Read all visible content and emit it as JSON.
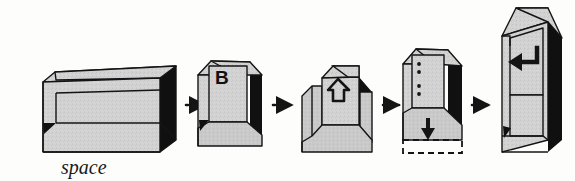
{
  "figure": {
    "type": "illustration",
    "background_color": "#fdfdfc",
    "outline_color": "#141414",
    "keytop_color": "#d2d2d2",
    "keyface_color": "#c9c9c9",
    "shadow_color": "#101010",
    "connector_style": "dotted-line-with-solid-arrowhead"
  },
  "keys": [
    {
      "id": "space",
      "order": 1,
      "caption": "space",
      "glyph": "",
      "glyph_name": "none",
      "description": "wide low spacebar keycap",
      "relative_size": "widest"
    },
    {
      "id": "letter-b",
      "order": 2,
      "caption": "",
      "glyph": "B",
      "glyph_name": "letter-b",
      "description": "standard single letter keycap",
      "relative_size": "standard"
    },
    {
      "id": "shift",
      "order": 3,
      "caption": "",
      "glyph": "⇧",
      "glyph_name": "up-arrow-outline-icon",
      "description": "shift keycap with side ridges and hollow up arrow",
      "relative_size": "tall-with-fins"
    },
    {
      "id": "dotted-travel",
      "order": 4,
      "caption": "",
      "glyph": "⠇",
      "glyph_name": "vertical-dots-icon",
      "description": "keycap with vertical dotted travel marks and downward press arrow over dashed footprint",
      "relative_size": "tall"
    },
    {
      "id": "enter",
      "order": 5,
      "caption": "",
      "glyph": "↵",
      "glyph_name": "enter-return-arrow-icon",
      "description": "tall stepped enter key with return arrow",
      "relative_size": "tallest"
    }
  ],
  "connectors": [
    {
      "id": "c1",
      "from": "space",
      "to": "letter-b",
      "marker": "arrowhead-right"
    },
    {
      "id": "c2",
      "from": "letter-b",
      "to": "shift",
      "marker": "arrowhead-right"
    },
    {
      "id": "c3",
      "from": "shift",
      "to": "dotted-travel",
      "marker": "arrowhead-right"
    },
    {
      "id": "c4",
      "from": "dotted-travel",
      "to": "enter",
      "marker": "arrowhead-right"
    }
  ],
  "annotations": {
    "press_arrow": {
      "glyph": "↓",
      "glyph_name": "down-arrow-solid-icon"
    },
    "dashed_footprint_label": ""
  }
}
